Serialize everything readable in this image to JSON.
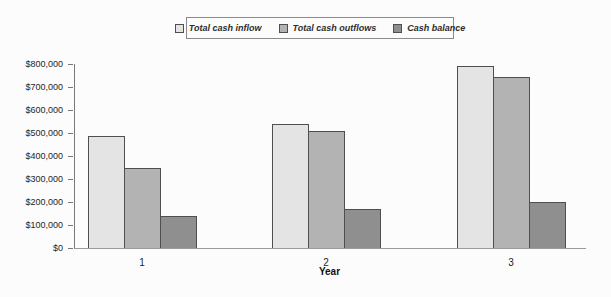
{
  "page": {
    "background": "#fcfcfc"
  },
  "legend": {
    "position": "top-center",
    "border_color": "#8a8a8a",
    "items": [
      "Total cash inflow",
      "Total cash outflows",
      "Cash balance"
    ]
  },
  "chart_data": {
    "type": "bar",
    "title": "",
    "xlabel": "Year",
    "ylabel": "",
    "categories": [
      "1",
      "2",
      "3"
    ],
    "series": [
      {
        "name": "Total cash inflow",
        "color": "#e4e4e4",
        "values": [
          485000,
          540000,
          790000
        ]
      },
      {
        "name": "Total cash outflows",
        "color": "#b3b3b3",
        "values": [
          350000,
          510000,
          745000
        ]
      },
      {
        "name": "Cash balance",
        "color": "#8f8f8f",
        "values": [
          140000,
          170000,
          200000
        ]
      }
    ],
    "ylim": [
      0,
      800000
    ],
    "ytick_step": 100000,
    "yticklabels": [
      "$0",
      "$100,000",
      "$200,000",
      "$300,000",
      "$400,000",
      "$500,000",
      "$600,000",
      "$700,000",
      "$800,000"
    ],
    "grid": false,
    "bar_border_color": "#4f4f4f",
    "legend_position": "top-center",
    "legend_style": "italic-bold-boxed"
  }
}
